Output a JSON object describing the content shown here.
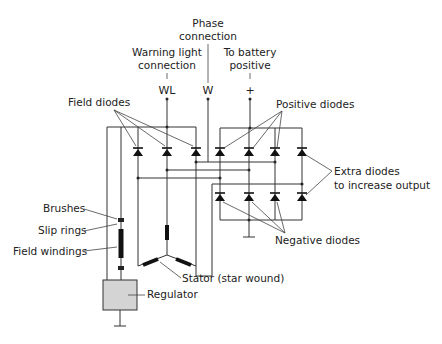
{
  "diagram": {
    "terminals": {
      "wl": {
        "symbol": "WL",
        "label_line1": "Warning light",
        "label_line2": "connection"
      },
      "w": {
        "symbol": "W",
        "label_line1": "Phase",
        "label_line2": "connection"
      },
      "plus": {
        "symbol": "+",
        "label_line1": "To battery",
        "label_line2": "positive"
      }
    },
    "labels": {
      "field_diodes": "Field diodes",
      "positive_diodes": "Positive diodes",
      "extra_diodes_line1": "Extra diodes",
      "extra_diodes_line2": "to increase output",
      "negative_diodes": "Negative diodes",
      "brushes": "Brushes",
      "slip_rings": "Slip rings",
      "field_windings": "Field windings",
      "stator": "Stator (star wound)",
      "regulator": "Regulator"
    },
    "components": {
      "field_diode_count": 3,
      "positive_diode_count": 3,
      "extra_diode_count": 2,
      "negative_diode_count": 3,
      "stator_windings": 3
    }
  }
}
